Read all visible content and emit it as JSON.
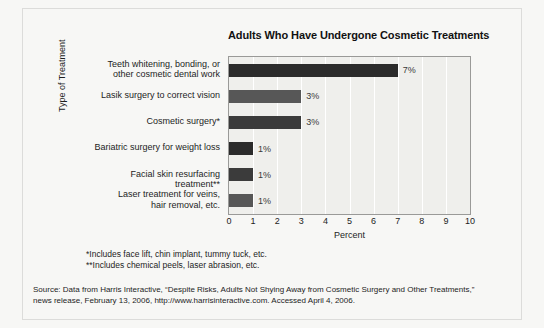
{
  "chart_data": {
    "type": "bar",
    "orientation": "horizontal",
    "title": "Adults Who Have Undergone Cosmetic Treatments",
    "xlabel": "Percent",
    "ylabel": "Type of Treatment",
    "xlim": [
      0,
      10
    ],
    "xticks": [
      "0",
      "1",
      "2",
      "3",
      "4",
      "5",
      "6",
      "7",
      "8",
      "9",
      "10"
    ],
    "grid": true,
    "legend": "none",
    "categories": [
      "Teeth whitening, bonding, or\nother cosmetic dental work",
      "Lasik surgery to correct vision",
      "Cosmetic surgery*",
      "Bariatric surgery for weight loss",
      "Facial skin resurfacing treatment**",
      "Laser treatment for veins,\nhair removal, etc."
    ],
    "values": [
      7,
      3,
      3,
      1,
      1,
      1
    ],
    "value_labels": [
      "7%",
      "3%",
      "3%",
      "1%",
      "1%",
      "1%"
    ],
    "bar_colors": [
      "#2b2b2b",
      "#575757",
      "#3b3b3b",
      "#2b2b2b",
      "#3b3b3b",
      "#575757"
    ]
  },
  "footnotes": [
    "*Includes face lift, chin implant, tummy tuck, etc.",
    "**Includes chemical peels, laser abrasion, etc."
  ],
  "source": {
    "lines": [
      "Source: Data from Harris Interactive, “Despite Risks, Adults Not Shying Away from Cosmetic Surgery and Other Treatments,”",
      "news release, February 13, 2006, http://www.harrisinteractive.com. Accessed April 4, 2006."
    ]
  }
}
